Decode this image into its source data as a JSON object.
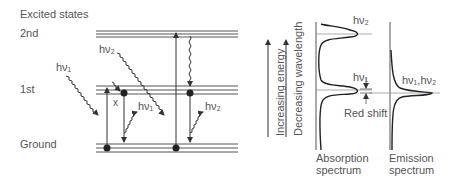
{
  "levels": {
    "excited_states": "Excited states",
    "second": "2nd",
    "first": "1st",
    "ground": "Ground"
  },
  "photons": {
    "hv1_in": "hν₁",
    "hv2_in": "hν₂",
    "hv1_out": "hν₁",
    "hv2_out": "hν₂"
  },
  "marker_x": "x",
  "axes": {
    "increasing_energy": "Increasing energy",
    "decreasing_wavelength": "Decreasing wavelength"
  },
  "absorption": {
    "peak_hv2": "hν₂",
    "peak_hv1": "hν₁",
    "title_line1": "Absorption",
    "title_line2": "spectrum"
  },
  "emission": {
    "peak": "hν₁,hν₂",
    "title_line1": "Emission",
    "title_line2": "spectrum"
  },
  "red_shift": "Red shift",
  "colors": {
    "line": "#3a3a3a",
    "text": "#555555"
  }
}
